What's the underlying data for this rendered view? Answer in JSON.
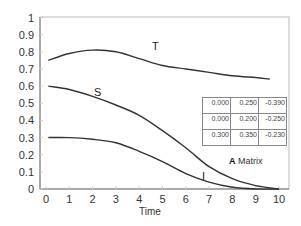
{
  "chart_data": {
    "type": "line",
    "title": "",
    "xlabel": "Time",
    "ylabel": "",
    "xlim": [
      0,
      10
    ],
    "ylim": [
      0,
      1
    ],
    "x_ticks": [
      "0",
      "1",
      "2",
      "3",
      "4",
      "5",
      "6",
      "7",
      "8",
      "9",
      "10"
    ],
    "y_ticks": [
      "0",
      "0.1",
      "0.2",
      "0.3",
      "0.4",
      "0.5",
      "0.6",
      "0.7",
      "0.8",
      "0.9",
      "1"
    ],
    "grid": false,
    "legend": "inline curve labels",
    "x": [
      0.1,
      1,
      2,
      3,
      4,
      5,
      6,
      7,
      8,
      9,
      10
    ],
    "series": [
      {
        "name": "T",
        "values": [
          0.75,
          0.79,
          0.81,
          0.8,
          0.76,
          0.72,
          0.7,
          0.68,
          0.66,
          0.65,
          0.64
        ]
      },
      {
        "name": "S",
        "values": [
          0.6,
          0.58,
          0.54,
          0.49,
          0.43,
          0.34,
          0.24,
          0.13,
          0.06,
          0.02,
          0.0
        ]
      },
      {
        "name": "I",
        "values": [
          0.3,
          0.3,
          0.29,
          0.27,
          0.22,
          0.16,
          0.09,
          0.04,
          0.01,
          0.0,
          0.0
        ]
      }
    ],
    "annotations": {
      "matrix_title_bold": "A",
      "matrix_title_rest": " Matrix",
      "matrix": [
        [
          "0.000",
          "0.250",
          "-0.390"
        ],
        [
          "0.000",
          "0.200",
          "-0.250"
        ],
        [
          "0.300",
          "0.350",
          "-0.230"
        ]
      ]
    }
  },
  "labels": {
    "T": "T",
    "S": "S",
    "I": "I",
    "time": "Time"
  }
}
